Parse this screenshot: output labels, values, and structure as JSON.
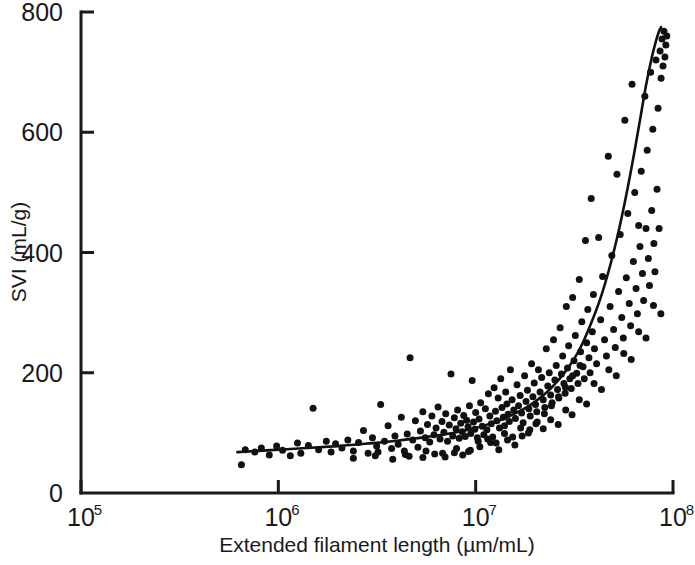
{
  "chart_data": {
    "type": "scatter",
    "title": "",
    "xlabel": "Extended filament length (µm/mL)",
    "ylabel": "SVI (mL/g)",
    "xscale": "log",
    "yscale": "linear",
    "xlim": [
      100000,
      100000000
    ],
    "ylim": [
      0,
      800
    ],
    "grid": false,
    "legend": null,
    "x_tick_labels": [
      "10",
      "10",
      "10",
      "10"
    ],
    "x_tick_exponents": [
      "5",
      "6",
      "7",
      "8"
    ],
    "x_tick_values": [
      100000,
      1000000,
      10000000,
      100000000
    ],
    "y_tick_labels": [
      "0",
      "200",
      "400",
      "600",
      "800"
    ],
    "y_tick_values": [
      0,
      200,
      400,
      600,
      800
    ],
    "series": [
      {
        "name": "observations",
        "marker": "filled-circle",
        "color": "#111111",
        "points": [
          [
            650000,
            47
          ],
          [
            680000,
            72
          ],
          [
            760000,
            68
          ],
          [
            820000,
            75
          ],
          [
            900000,
            63
          ],
          [
            980000,
            78
          ],
          [
            1050000,
            71
          ],
          [
            1150000,
            62
          ],
          [
            1250000,
            83
          ],
          [
            1300000,
            66
          ],
          [
            1420000,
            79
          ],
          [
            1500000,
            141
          ],
          [
            1600000,
            72
          ],
          [
            1750000,
            86
          ],
          [
            1850000,
            68
          ],
          [
            1950000,
            82
          ],
          [
            2100000,
            75
          ],
          [
            2250000,
            88
          ],
          [
            2400000,
            70
          ],
          [
            2550000,
            84
          ],
          [
            2700000,
            104
          ],
          [
            2850000,
            66
          ],
          [
            3000000,
            92
          ],
          [
            3150000,
            78
          ],
          [
            3300000,
            147
          ],
          [
            3450000,
            86
          ],
          [
            3600000,
            112
          ],
          [
            3750000,
            74
          ],
          [
            3900000,
            95
          ],
          [
            4050000,
            81
          ],
          [
            4200000,
            126
          ],
          [
            4350000,
            70
          ],
          [
            4500000,
            98
          ],
          [
            4650000,
            225
          ],
          [
            4800000,
            88
          ],
          [
            4950000,
            120
          ],
          [
            5100000,
            76
          ],
          [
            5250000,
            103
          ],
          [
            5400000,
            135
          ],
          [
            5550000,
            92
          ],
          [
            5700000,
            114
          ],
          [
            5850000,
            85
          ],
          [
            6000000,
            128
          ],
          [
            6150000,
            97
          ],
          [
            6300000,
            108
          ],
          [
            6450000,
            143
          ],
          [
            6600000,
            90
          ],
          [
            6750000,
            119
          ],
          [
            6900000,
            101
          ],
          [
            7050000,
            132
          ],
          [
            7200000,
            86
          ],
          [
            7350000,
            113
          ],
          [
            7500000,
            198
          ],
          [
            7650000,
            95
          ],
          [
            7800000,
            125
          ],
          [
            7950000,
            107
          ],
          [
            8100000,
            138
          ],
          [
            8250000,
            91
          ],
          [
            8400000,
            116
          ],
          [
            8550000,
            102
          ],
          [
            8700000,
            129
          ],
          [
            8850000,
            94
          ],
          [
            9000000,
            121
          ],
          [
            9150000,
            110
          ],
          [
            9300000,
            145
          ],
          [
            9450000,
            99
          ],
          [
            9600000,
            187
          ],
          [
            9750000,
            118
          ],
          [
            9900000,
            106
          ],
          [
            10000000,
            134
          ],
          [
            10200000,
            92
          ],
          [
            10400000,
            123
          ],
          [
            10600000,
            150
          ],
          [
            10800000,
            111
          ],
          [
            11000000,
            97
          ],
          [
            11200000,
            140
          ],
          [
            11400000,
            105
          ],
          [
            11600000,
            165
          ],
          [
            11800000,
            128
          ],
          [
            12000000,
            115
          ],
          [
            12200000,
            93
          ],
          [
            12400000,
            175
          ],
          [
            12600000,
            136
          ],
          [
            12800000,
            120
          ],
          [
            13000000,
            158
          ],
          [
            13200000,
            108
          ],
          [
            13400000,
            190
          ],
          [
            13600000,
            142
          ],
          [
            13800000,
            126
          ],
          [
            14000000,
            112
          ],
          [
            14200000,
            168
          ],
          [
            14400000,
            148
          ],
          [
            14600000,
            131
          ],
          [
            14800000,
            119
          ],
          [
            15000000,
            205
          ],
          [
            15300000,
            155
          ],
          [
            15600000,
            138
          ],
          [
            15900000,
            124
          ],
          [
            16200000,
            180
          ],
          [
            16500000,
            145
          ],
          [
            16800000,
            162
          ],
          [
            17100000,
            133
          ],
          [
            17400000,
            117
          ],
          [
            17700000,
            195
          ],
          [
            18000000,
            152
          ],
          [
            18300000,
            171
          ],
          [
            18600000,
            140
          ],
          [
            18900000,
            128
          ],
          [
            19200000,
            215
          ],
          [
            19500000,
            160
          ],
          [
            19800000,
            183
          ],
          [
            20100000,
            147
          ],
          [
            20400000,
            135
          ],
          [
            20800000,
            205
          ],
          [
            21200000,
            168
          ],
          [
            21600000,
            192
          ],
          [
            22000000,
            155
          ],
          [
            22400000,
            142
          ],
          [
            22800000,
            240
          ],
          [
            23200000,
            178
          ],
          [
            23600000,
            200
          ],
          [
            24000000,
            163
          ],
          [
            24400000,
            150
          ],
          [
            24800000,
            255
          ],
          [
            25200000,
            188
          ],
          [
            25600000,
            212
          ],
          [
            26000000,
            172
          ],
          [
            26400000,
            158
          ],
          [
            26800000,
            275
          ],
          [
            27200000,
            198
          ],
          [
            27600000,
            228
          ],
          [
            28000000,
            182
          ],
          [
            28400000,
            166
          ],
          [
            28800000,
            310
          ],
          [
            29200000,
            208
          ],
          [
            29600000,
            245
          ],
          [
            30000000,
            190
          ],
          [
            30500000,
            174
          ],
          [
            31000000,
            325
          ],
          [
            31500000,
            220
          ],
          [
            32000000,
            262
          ],
          [
            32500000,
            199
          ],
          [
            33000000,
            182
          ],
          [
            33500000,
            355
          ],
          [
            34000000,
            235
          ],
          [
            34500000,
            285
          ],
          [
            35000000,
            210
          ],
          [
            35500000,
            190
          ],
          [
            36000000,
            420
          ],
          [
            36500000,
            250
          ],
          [
            37000000,
            305
          ],
          [
            37500000,
            225
          ],
          [
            38000000,
            200
          ],
          [
            38500000,
            490
          ],
          [
            39000000,
            268
          ],
          [
            39500000,
            330
          ],
          [
            40000000,
            240
          ],
          [
            41000000,
            215
          ],
          [
            42000000,
            425
          ],
          [
            43000000,
            288
          ],
          [
            44000000,
            360
          ],
          [
            45000000,
            255
          ],
          [
            46000000,
            228
          ],
          [
            47000000,
            560
          ],
          [
            48000000,
            310
          ],
          [
            49000000,
            395
          ],
          [
            50000000,
            272
          ],
          [
            51000000,
            242
          ],
          [
            52000000,
            530
          ],
          [
            53000000,
            335
          ],
          [
            54000000,
            430
          ],
          [
            55000000,
            292
          ],
          [
            56000000,
            258
          ],
          [
            57000000,
            620
          ],
          [
            58000000,
            358
          ],
          [
            59000000,
            465
          ],
          [
            60000000,
            315
          ],
          [
            61000000,
            278
          ],
          [
            62000000,
            680
          ],
          [
            63000000,
            385
          ],
          [
            64000000,
            500
          ],
          [
            65000000,
            340
          ],
          [
            66000000,
            298
          ],
          [
            67000000,
            445
          ],
          [
            68000000,
            410
          ],
          [
            69000000,
            535
          ],
          [
            70000000,
            365
          ],
          [
            71000000,
            320
          ],
          [
            72000000,
            660
          ],
          [
            73000000,
            440
          ],
          [
            74000000,
            570
          ],
          [
            75000000,
            390
          ],
          [
            76000000,
            345
          ],
          [
            77000000,
            700
          ],
          [
            78000000,
            470
          ],
          [
            79000000,
            605
          ],
          [
            80000000,
            415
          ],
          [
            81000000,
            368
          ],
          [
            82000000,
            720
          ],
          [
            83000000,
            505
          ],
          [
            84000000,
            640
          ],
          [
            85000000,
            440
          ],
          [
            86000000,
            735
          ],
          [
            87000000,
            690
          ],
          [
            88000000,
            755
          ],
          [
            89000000,
            710
          ],
          [
            90000000,
            768
          ],
          [
            91000000,
            725
          ],
          [
            92000000,
            745
          ],
          [
            93000000,
            760
          ],
          [
            3200000,
            68
          ],
          [
            4400000,
            64
          ],
          [
            5600000,
            70
          ],
          [
            6800000,
            66
          ],
          [
            8000000,
            74
          ],
          [
            9200000,
            69
          ],
          [
            10500000,
            77
          ],
          [
            11900000,
            84
          ],
          [
            13100000,
            72
          ],
          [
            14500000,
            88
          ],
          [
            15800000,
            80
          ],
          [
            17200000,
            95
          ],
          [
            18800000,
            105
          ],
          [
            20500000,
            118
          ],
          [
            22300000,
            132
          ],
          [
            24200000,
            145
          ],
          [
            26300000,
            160
          ],
          [
            28500000,
            176
          ],
          [
            31000000,
            195
          ],
          [
            33800000,
            212
          ],
          [
            2400000,
            58
          ],
          [
            3100000,
            62
          ],
          [
            3800000,
            56
          ],
          [
            4600000,
            61
          ],
          [
            5400000,
            59
          ],
          [
            6200000,
            65
          ],
          [
            7000000,
            60
          ],
          [
            7800000,
            67
          ],
          [
            8600000,
            63
          ],
          [
            9400000,
            71
          ],
          [
            10300000,
            86
          ],
          [
            11500000,
            90
          ],
          [
            12700000,
            83
          ],
          [
            14000000,
            99
          ],
          [
            15400000,
            93
          ],
          [
            16900000,
            108
          ],
          [
            18500000,
            100
          ],
          [
            20200000,
            115
          ],
          [
            22000000,
            107
          ],
          [
            24000000,
            122
          ],
          [
            26200000,
            114
          ],
          [
            28600000,
            138
          ],
          [
            30800000,
            130
          ],
          [
            33500000,
            155
          ],
          [
            36500000,
            148
          ],
          [
            39800000,
            182
          ],
          [
            43400000,
            172
          ],
          [
            47300000,
            205
          ],
          [
            51600000,
            195
          ],
          [
            56300000,
            232
          ],
          [
            61400000,
            222
          ],
          [
            67000000,
            268
          ],
          [
            73000000,
            258
          ],
          [
            79600000,
            312
          ],
          [
            86800000,
            298
          ]
        ]
      }
    ],
    "fit_curve": {
      "name": "fitted trend line",
      "color": "#111111",
      "points": [
        [
          620000,
          68
        ],
        [
          1000000,
          72
        ],
        [
          2000000,
          78
        ],
        [
          3000000,
          83
        ],
        [
          4000000,
          87
        ],
        [
          5000000,
          91
        ],
        [
          6500000,
          96
        ],
        [
          8000000,
          101
        ],
        [
          10000000,
          108
        ],
        [
          12000000,
          116
        ],
        [
          14000000,
          124
        ],
        [
          16000000,
          133
        ],
        [
          18000000,
          142
        ],
        [
          20000000,
          152
        ],
        [
          23000000,
          168
        ],
        [
          26000000,
          186
        ],
        [
          30000000,
          212
        ],
        [
          34000000,
          242
        ],
        [
          38000000,
          278
        ],
        [
          43000000,
          325
        ],
        [
          48000000,
          378
        ],
        [
          53000000,
          435
        ],
        [
          58000000,
          496
        ],
        [
          63000000,
          558
        ],
        [
          68000000,
          620
        ],
        [
          73000000,
          678
        ],
        [
          78000000,
          724
        ],
        [
          82000000,
          752
        ],
        [
          85000000,
          768
        ],
        [
          87000000,
          775
        ]
      ]
    }
  },
  "axes": {
    "x_title": "Extended filament length (µm/mL)",
    "y_title": "SVI (mL/g)"
  }
}
